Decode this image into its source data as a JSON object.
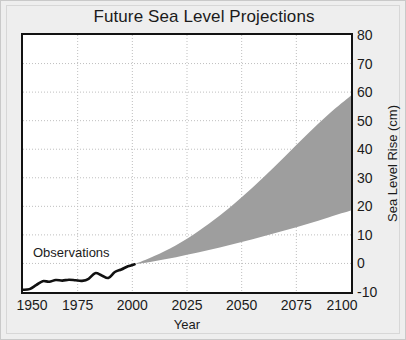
{
  "chart_data": {
    "type": "area",
    "title": "Future Sea Level Projections",
    "xlabel": "Year",
    "ylabel": "Sea Level Rise (cm)",
    "xlim": [
      1950,
      2100
    ],
    "ylim": [
      -10,
      80
    ],
    "xticks": [
      1950,
      1975,
      2000,
      2025,
      2050,
      2075,
      2100
    ],
    "xtick_labels": [
      "1950",
      "1975",
      "2000",
      "2025",
      "2050",
      "2075",
      "2100"
    ],
    "yticks": [
      -10,
      0,
      10,
      20,
      30,
      40,
      50,
      60,
      70,
      80
    ],
    "ytick_labels": [
      "-10",
      "0",
      "10",
      "20",
      "30",
      "40",
      "50",
      "60",
      "70",
      "80"
    ],
    "yaxis_position": "right",
    "grid": true,
    "grid_style": "dotted",
    "grid_color": "#bfbfbf",
    "legend": "none",
    "annotations": [
      {
        "text": "Observations",
        "x": 1958,
        "y": 5
      }
    ],
    "series": [
      {
        "name": "Observations",
        "type": "line",
        "color": "#111111",
        "x": [
          1950,
          1953,
          1956,
          1959,
          1962,
          1965,
          1968,
          1971,
          1974,
          1977,
          1980,
          1983,
          1986,
          1989,
          1992,
          1995,
          1998,
          2001
        ],
        "values": [
          -9.2,
          -9.0,
          -7.6,
          -6.2,
          -6.4,
          -5.8,
          -6.0,
          -5.7,
          -5.9,
          -6.1,
          -5.4,
          -3.4,
          -4.2,
          -5.1,
          -3.0,
          -2.1,
          -1.0,
          -0.3
        ]
      },
      {
        "name": "Projection range (low)",
        "type": "band-lower",
        "color": "#9e9e9e",
        "x": [
          2001,
          2010,
          2020,
          2030,
          2040,
          2050,
          2060,
          2070,
          2080,
          2090,
          2100
        ],
        "values": [
          -0.3,
          0.8,
          2.2,
          3.8,
          5.6,
          7.5,
          9.5,
          11.6,
          13.8,
          16.2,
          18.5
        ]
      },
      {
        "name": "Projection range (high)",
        "type": "band-upper",
        "color": "#9e9e9e",
        "x": [
          2001,
          2010,
          2020,
          2030,
          2040,
          2050,
          2060,
          2070,
          2080,
          2090,
          2100
        ],
        "values": [
          -0.3,
          2.6,
          6.4,
          11.2,
          16.8,
          23.2,
          30.2,
          37.6,
          45.2,
          52.4,
          58.8
        ]
      }
    ],
    "band_fill_color": "#9e9e9e"
  },
  "figure": {
    "background": "#eeeeee",
    "plot_background": "#ffffff",
    "frame_color": "#121212"
  }
}
